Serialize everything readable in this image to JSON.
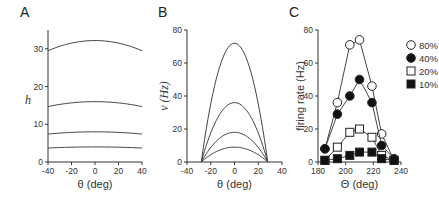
{
  "chart_data": [
    {
      "panel": "A",
      "type": "line",
      "xlabel": "θ (deg)",
      "ylabel": "h",
      "xlim": [
        -40,
        40
      ],
      "ylim": [
        0,
        35
      ],
      "xticks": [
        "-40",
        "-20",
        "0",
        "20",
        "40"
      ],
      "yticks": [
        "0",
        "10",
        "20",
        "30"
      ],
      "series": [
        {
          "name": "curve1",
          "x": [
            -40,
            -20,
            0,
            20,
            40
          ],
          "values": [
            29.5,
            31.5,
            32.2,
            31.5,
            29.5
          ]
        },
        {
          "name": "curve2",
          "x": [
            -40,
            -20,
            0,
            20,
            40
          ],
          "values": [
            14.7,
            15.7,
            16.0,
            15.7,
            14.7
          ]
        },
        {
          "name": "curve3",
          "x": [
            -40,
            -20,
            0,
            20,
            40
          ],
          "values": [
            7.4,
            7.8,
            8.0,
            7.8,
            7.4
          ]
        },
        {
          "name": "curve4",
          "x": [
            -40,
            -20,
            0,
            20,
            40
          ],
          "values": [
            3.7,
            3.9,
            4.0,
            3.9,
            3.7
          ]
        }
      ]
    },
    {
      "panel": "B",
      "type": "line",
      "xlabel": "θ (deg)",
      "ylabel": "v (Hz)",
      "xlim": [
        -40,
        40
      ],
      "ylim": [
        0,
        80
      ],
      "xticks": [
        "-40",
        "-20",
        "0",
        "20",
        "40"
      ],
      "yticks": [
        "0",
        "20",
        "40",
        "60",
        "80"
      ],
      "series": [
        {
          "name": "curve1",
          "x": [
            -28,
            -20,
            -10,
            0,
            10,
            20,
            28
          ],
          "values": [
            0,
            35,
            62,
            72,
            62,
            35,
            0
          ]
        },
        {
          "name": "curve2",
          "x": [
            -28,
            -20,
            -10,
            0,
            10,
            20,
            28
          ],
          "values": [
            0,
            17.5,
            31,
            36,
            31,
            17.5,
            0
          ]
        },
        {
          "name": "curve3",
          "x": [
            -28,
            -20,
            -10,
            0,
            10,
            20,
            28
          ],
          "values": [
            0,
            9,
            15.5,
            18,
            15.5,
            9,
            0
          ]
        },
        {
          "name": "curve4",
          "x": [
            -28,
            -20,
            -10,
            0,
            10,
            20,
            28
          ],
          "values": [
            0,
            4.5,
            8,
            9,
            8,
            4.5,
            0
          ]
        }
      ]
    },
    {
      "panel": "C",
      "type": "line",
      "xlabel": "Θ (deg)",
      "ylabel": "firing rate (Hz)",
      "xlim": [
        180,
        240
      ],
      "ylim": [
        0,
        80
      ],
      "xticks": [
        "180",
        "200",
        "220",
        "240"
      ],
      "yticks": [
        "0",
        "20",
        "40",
        "60",
        "80"
      ],
      "legend_position": "upper right",
      "x": [
        185,
        194,
        203,
        210,
        219,
        226,
        235
      ],
      "series": [
        {
          "name": "80%",
          "marker": "open-circle",
          "values": [
            8,
            36,
            71,
            74,
            46,
            17,
            1
          ]
        },
        {
          "name": "40%",
          "marker": "filled-circle",
          "values": [
            8,
            29,
            40,
            50,
            36,
            10,
            2
          ]
        },
        {
          "name": "20%",
          "marker": "open-square",
          "values": [
            1,
            9,
            18,
            20,
            15,
            4,
            1
          ]
        },
        {
          "name": "10%",
          "marker": "filled-square",
          "values": [
            1,
            2,
            4,
            6,
            6,
            2,
            1
          ]
        }
      ]
    }
  ]
}
